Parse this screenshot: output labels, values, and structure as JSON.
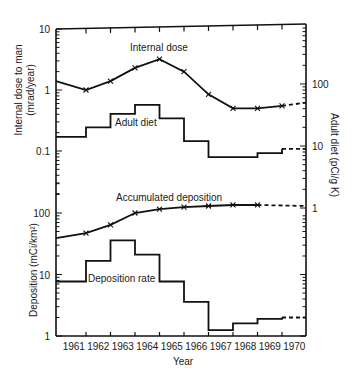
{
  "chart_data": [
    {
      "type": "line",
      "panel": "upper",
      "ylabel_left": "Internal dose to man (mrad/year)",
      "ylabel_right": "Adult diet (pCi/g K)",
      "yscale": "log",
      "ylim_left": [
        0.01,
        10
      ],
      "yticks_left": [
        "10",
        "1",
        "0.1"
      ],
      "ylim_right": [
        1,
        1000
      ],
      "yticks_right": [
        "100",
        "10",
        "1"
      ],
      "series": [
        {
          "name": "Internal dose",
          "axis": "left",
          "style": "line-with-x-markers",
          "x": [
            1960.5,
            1961.5,
            1962.5,
            1963.5,
            1964.5,
            1965.5,
            1966.5,
            1967.5,
            1968.5,
            1969.5,
            1970.5
          ],
          "values": [
            1.4,
            1.0,
            1.4,
            2.3,
            3.2,
            2.0,
            0.85,
            0.5,
            0.5,
            0.55,
            0.62
          ],
          "projected_from_index": 9
        },
        {
          "name": "Adult diet",
          "axis": "right",
          "style": "step",
          "years": [
            1961,
            1962,
            1963,
            1964,
            1965,
            1966,
            1967,
            1968,
            1969,
            1970
          ],
          "values": [
            14,
            20,
            33,
            46,
            28,
            12,
            6.6,
            6.6,
            7.7,
            9
          ],
          "projected_years": [
            1970
          ]
        }
      ]
    },
    {
      "type": "line",
      "panel": "lower",
      "ylabel": "Deposition (mCi/km²)",
      "yscale": "log",
      "ylim": [
        1,
        1000
      ],
      "yticks": [
        "100",
        "10",
        "1"
      ],
      "xlabel": "Year",
      "categories": [
        "1961",
        "1962",
        "1963",
        "1964",
        "1965",
        "1966",
        "1967",
        "1968",
        "1969",
        "1970"
      ],
      "series": [
        {
          "name": "Accumulated deposition",
          "style": "line-with-x-markers",
          "x": [
            1960.5,
            1961.5,
            1962.5,
            1963.5,
            1964.5,
            1965.5,
            1966.5,
            1967.5,
            1968.5,
            1970.5
          ],
          "values": [
            39,
            47,
            64,
            100,
            116,
            125,
            130,
            135,
            135,
            130
          ],
          "projected_from_index": 8
        },
        {
          "name": "Deposition rate",
          "style": "step",
          "years": [
            1961,
            1962,
            1963,
            1964,
            1965,
            1966,
            1967,
            1968,
            1969,
            1970
          ],
          "values": [
            7.7,
            16.7,
            36,
            21,
            7.7,
            3.6,
            1.25,
            1.6,
            1.9,
            2.0
          ],
          "projected_years": [
            1970
          ]
        }
      ]
    }
  ],
  "labels": {
    "internal_dose": "Internal dose",
    "adult_diet": "Adult diet",
    "accumulated_deposition": "Accumulated deposition",
    "deposition_rate": "Deposition rate",
    "ylabel_upper_line1": "Internal dose to man",
    "ylabel_upper_line2": "(mrad/year)",
    "ylabel_right": "Adult diet (pCi/g K)",
    "ylabel_lower": "Deposition (mCi/km²)",
    "xlabel": "Year"
  }
}
